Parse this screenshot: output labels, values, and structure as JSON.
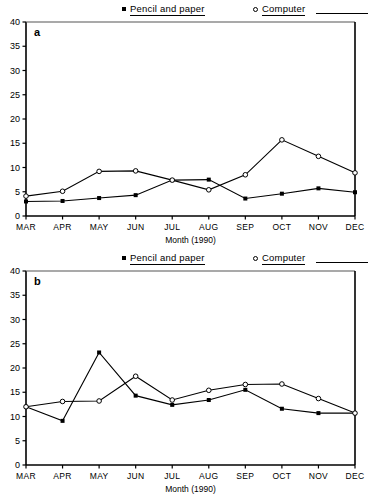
{
  "legend": {
    "pencil_label": "Pencil and paper",
    "computer_label": "Computer",
    "pencil_marker": "filled-square-marker",
    "computer_marker": "open-circle-marker"
  },
  "panels": [
    {
      "letter": "a"
    },
    {
      "letter": "b"
    }
  ],
  "axis": {
    "xlabel": "Month (1990)",
    "yticks": [
      "0",
      "5",
      "10",
      "15",
      "20",
      "25",
      "30",
      "35",
      "40"
    ],
    "xticks": [
      "MAR",
      "APR",
      "MAY",
      "JUN",
      "JUL",
      "AUG",
      "SEP",
      "OCT",
      "NOV",
      "DEC"
    ]
  },
  "chart_data": [
    {
      "type": "line",
      "panel": "a",
      "title": "",
      "xlabel": "Month (1990)",
      "ylabel": "",
      "categories": [
        "MAR",
        "APR",
        "MAY",
        "JUN",
        "JUL",
        "AUG",
        "SEP",
        "OCT",
        "NOV",
        "DEC"
      ],
      "ylim": [
        0,
        40
      ],
      "ytick_step": 5,
      "grid": false,
      "legend_position": "top",
      "series": [
        {
          "name": "Pencil and paper",
          "marker": "filled-square",
          "values": [
            3.0,
            3.1,
            3.7,
            4.3,
            7.4,
            7.5,
            3.6,
            4.6,
            5.7,
            4.9
          ]
        },
        {
          "name": "Computer",
          "marker": "open-circle",
          "values": [
            4.1,
            5.1,
            9.2,
            9.3,
            7.4,
            5.4,
            8.5,
            15.7,
            12.3,
            8.9
          ]
        }
      ]
    },
    {
      "type": "line",
      "panel": "b",
      "title": "",
      "xlabel": "Month (1990)",
      "ylabel": "",
      "categories": [
        "MAR",
        "APR",
        "MAY",
        "JUN",
        "JUL",
        "AUG",
        "SEP",
        "OCT",
        "NOV",
        "DEC"
      ],
      "ylim": [
        0,
        40
      ],
      "ytick_step": 5,
      "grid": false,
      "legend_position": "top",
      "series": [
        {
          "name": "Pencil and paper",
          "marker": "filled-square",
          "values": [
            12.0,
            9.1,
            23.2,
            14.3,
            12.4,
            13.4,
            15.5,
            11.6,
            10.7,
            10.7
          ]
        },
        {
          "name": "Computer",
          "marker": "open-circle",
          "values": [
            12.0,
            13.1,
            13.2,
            18.3,
            13.4,
            15.4,
            16.6,
            16.7,
            13.7,
            10.7
          ]
        }
      ]
    }
  ]
}
